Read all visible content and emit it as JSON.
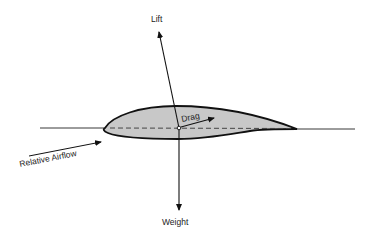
{
  "diagram": {
    "labels": {
      "lift": "Lift",
      "weight": "Weight",
      "drag": "Drag",
      "relative_airflow": "Relative Airflow"
    },
    "colors": {
      "airfoil_fill": "#c8c8c8",
      "stroke": "#111111",
      "chord_dash": "#444444",
      "background": "#ffffff"
    }
  }
}
